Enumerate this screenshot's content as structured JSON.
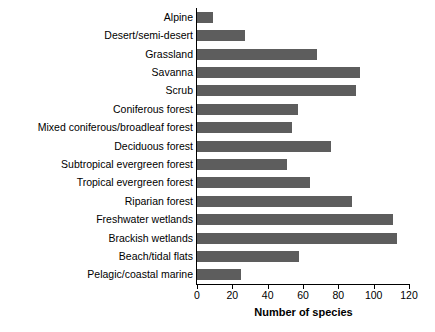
{
  "chart_data": {
    "type": "bar",
    "orientation": "horizontal",
    "title": "",
    "xlabel": "Number of species",
    "ylabel": "",
    "xlim": [
      0,
      120
    ],
    "xticks": [
      0,
      20,
      40,
      60,
      80,
      100,
      120
    ],
    "grid": false,
    "legend": null,
    "bar_color": "#5d5d5d",
    "categories": [
      "Alpine",
      "Desert/semi-desert",
      "Grassland",
      "Savanna",
      "Scrub",
      "Coniferous forest",
      "Mixed coniferous/broadleaf forest",
      "Deciduous forest",
      "Subtropical evergreen forest",
      "Tropical evergreen forest",
      "Riparian forest",
      "Freshwater wetlands",
      "Brackish wetlands",
      "Beach/tidal flats",
      "Pelagic/coastal marine"
    ],
    "values": [
      9,
      27,
      68,
      92,
      90,
      57,
      54,
      76,
      51,
      64,
      88,
      111,
      113,
      58,
      25
    ]
  }
}
